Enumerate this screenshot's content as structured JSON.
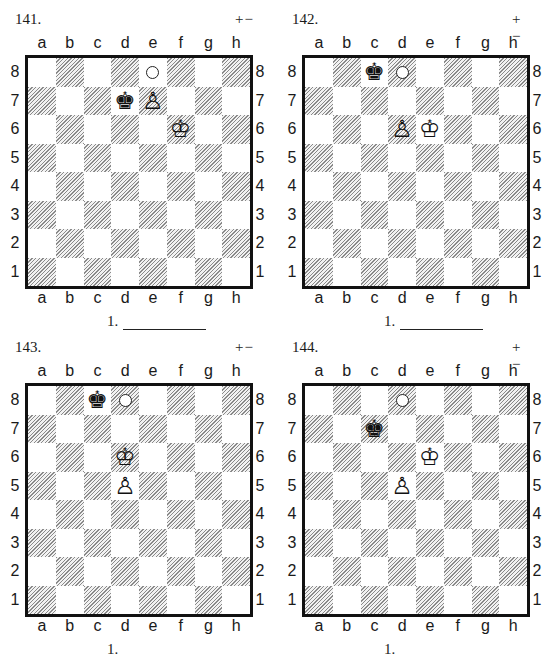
{
  "files": [
    "a",
    "b",
    "c",
    "d",
    "e",
    "f",
    "g",
    "h"
  ],
  "ranks": [
    "8",
    "7",
    "6",
    "5",
    "4",
    "3",
    "2",
    "1"
  ],
  "glyphs": {
    "white-king": "♔",
    "black-king": "♚",
    "white-pawn": "♙"
  },
  "diagrams": [
    {
      "number": "141.",
      "result": "+−",
      "answer_prefix": "1.",
      "answer_blank": true,
      "pieces": [
        {
          "type": "black-king",
          "square": "d7"
        },
        {
          "type": "white-pawn",
          "square": "e7"
        },
        {
          "type": "white-king",
          "square": "f6"
        }
      ],
      "markers": [
        {
          "square": "e8",
          "icon": "target-circle"
        }
      ]
    },
    {
      "number": "142.",
      "result": "+−",
      "answer_prefix": "1.",
      "answer_blank": true,
      "pieces": [
        {
          "type": "black-king",
          "square": "c8"
        },
        {
          "type": "white-pawn",
          "square": "d6"
        },
        {
          "type": "white-king",
          "square": "e6"
        }
      ],
      "markers": [
        {
          "square": "d8",
          "icon": "target-circle"
        }
      ]
    },
    {
      "number": "143.",
      "result": "+−",
      "answer_prefix": "1.",
      "answer_blank": false,
      "pieces": [
        {
          "type": "black-king",
          "square": "c8"
        },
        {
          "type": "white-king",
          "square": "d6"
        },
        {
          "type": "white-pawn",
          "square": "d5"
        }
      ],
      "markers": [
        {
          "square": "d8",
          "icon": "target-circle"
        }
      ]
    },
    {
      "number": "144.",
      "result": "+−",
      "answer_prefix": "1.",
      "answer_blank": false,
      "pieces": [
        {
          "type": "black-king",
          "square": "c7"
        },
        {
          "type": "white-king",
          "square": "e6"
        },
        {
          "type": "white-pawn",
          "square": "d5"
        }
      ],
      "markers": [
        {
          "square": "d8",
          "icon": "target-circle"
        }
      ]
    }
  ]
}
